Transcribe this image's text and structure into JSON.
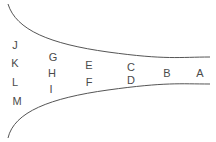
{
  "diagram": {
    "type": "funnel",
    "line_color": "#555555",
    "text_color": "#4a4a4a",
    "top_curve": "M8,4 C16,30 50,44 108,52 S180,57 210,57",
    "bottom_curve": "M8,138 C14,112 50,98 108,90 S180,84 210,84",
    "labels": [
      {
        "text": "A",
        "x": 200,
        "y": 73
      },
      {
        "text": "B",
        "x": 167,
        "y": 73
      },
      {
        "text": "C",
        "x": 131,
        "y": 67
      },
      {
        "text": "D",
        "x": 131,
        "y": 80
      },
      {
        "text": "E",
        "x": 89,
        "y": 65
      },
      {
        "text": "F",
        "x": 89,
        "y": 82
      },
      {
        "text": "G",
        "x": 53,
        "y": 57
      },
      {
        "text": "H",
        "x": 52,
        "y": 73
      },
      {
        "text": "I",
        "x": 51,
        "y": 89
      },
      {
        "text": "J",
        "x": 15,
        "y": 45
      },
      {
        "text": "K",
        "x": 15,
        "y": 63
      },
      {
        "text": "L",
        "x": 15,
        "y": 82
      },
      {
        "text": "M",
        "x": 17,
        "y": 101
      }
    ]
  }
}
